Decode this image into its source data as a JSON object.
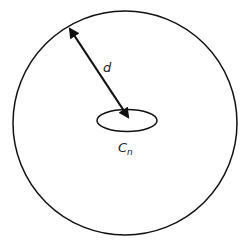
{
  "diagram": {
    "labels": {
      "distance": "d",
      "curve_main": "C",
      "curve_sub": "n"
    },
    "colors": {
      "stroke": "#111111",
      "text": "#222222",
      "background": "#ffffff"
    },
    "shapes": {
      "outer_circle": {
        "cx": 125,
        "cy": 123,
        "r": 112
      },
      "inner_ellipse": {
        "cx": 127,
        "cy": 120.5,
        "rx": 30,
        "ry": 11
      },
      "arrow": {
        "x1": 70,
        "y1": 29,
        "x2": 128,
        "y2": 117,
        "double_headed": true
      }
    }
  }
}
